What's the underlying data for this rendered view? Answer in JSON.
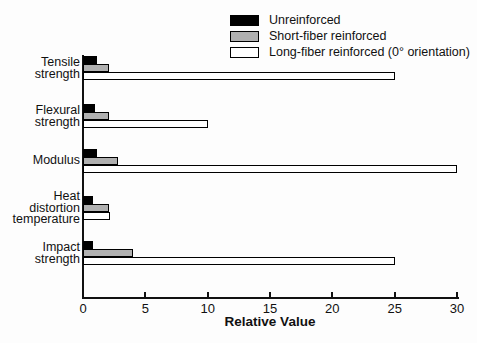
{
  "figure": {
    "background": "#fdfdfd",
    "text_color": "#111111",
    "axis_color": "#111111"
  },
  "chart_data": {
    "type": "bar",
    "orientation": "horizontal",
    "title": "",
    "xlabel": "Relative Value",
    "ylabel": "",
    "xlim": [
      0,
      30
    ],
    "xticks": [
      0,
      5,
      10,
      15,
      20,
      25,
      30
    ],
    "grid": false,
    "legend_position": "top-right",
    "categories": [
      "Tensile\nstrength",
      "Flexural\nstrength",
      "Modulus",
      "Heat\ndistortion\ntemperature",
      "Impact\nstrength"
    ],
    "series": [
      {
        "name": "Unreinforced",
        "color": "#000000",
        "border": false,
        "values": [
          1.1,
          1.0,
          1.1,
          0.8,
          0.8
        ]
      },
      {
        "name": "Short-fiber reinforced",
        "color": "#b0b0b0",
        "border": true,
        "values": [
          2.1,
          2.1,
          2.8,
          2.1,
          4.0
        ]
      },
      {
        "name": "Long-fiber reinforced (0° orientation)",
        "color": "#ffffff",
        "border": true,
        "values": [
          25,
          10,
          30,
          2.2,
          25
        ]
      }
    ]
  }
}
